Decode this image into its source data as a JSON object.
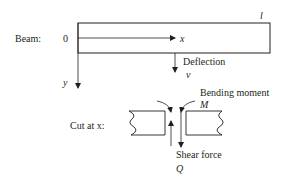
{
  "diagram": {
    "beam": {
      "label": "Beam:",
      "origin_label": "0",
      "x_axis_label": "x",
      "y_axis_label": "y",
      "length_label": "l",
      "deflection_label": "Deflection",
      "deflection_symbol": "v"
    },
    "cut": {
      "label": "Cut at x:",
      "bending_moment_label": "Bending moment",
      "bending_moment_symbol": "M",
      "shear_force_label": "Shear force",
      "shear_force_symbol": "Q"
    },
    "colors": {
      "stroke": "#231f20",
      "background": "#ffffff"
    }
  }
}
